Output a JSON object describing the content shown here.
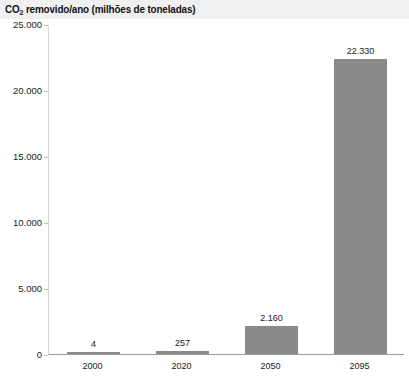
{
  "chart_data": {
    "type": "bar",
    "title": "CO2 removido/ano (milhões de toneladas)",
    "title_prefix": "CO",
    "title_subscript": "2",
    "title_suffix": " removido/ano (milhões de toneladas)",
    "xlabel": "",
    "ylabel": "",
    "categories": [
      "2000",
      "2020",
      "2050",
      "2095"
    ],
    "values": [
      4,
      257,
      2160,
      22330
    ],
    "value_labels": [
      "4",
      "257",
      "2.160",
      "22.330"
    ],
    "ylim": [
      0,
      25000
    ],
    "ytick_values": [
      0,
      5000,
      10000,
      15000,
      20000,
      25000
    ],
    "ytick_labels": [
      "0",
      "5.000",
      "10.000",
      "15.000",
      "20.000",
      "25.000"
    ],
    "grid": false,
    "legend": null,
    "bar_color": "#8a8a8a",
    "title_band_color": "#f0f0f0",
    "text_color": "#1a1a1a",
    "axis_color": "#9a9a9a"
  }
}
